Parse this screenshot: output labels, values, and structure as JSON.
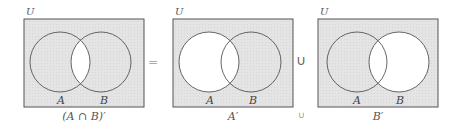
{
  "colors": {
    "shade": "#e2e2e2",
    "outline": "#555555",
    "blank": "#ffffff"
  },
  "diagrams": [
    {
      "universe_label": "U",
      "set_a_label": "A",
      "set_b_label": "B",
      "caption": "(A ∩ B)′",
      "shaded_region": "complement of A∩B"
    },
    {
      "universe_label": "U",
      "set_a_label": "A",
      "set_b_label": "B",
      "caption": "A′",
      "shaded_region": "complement of A"
    },
    {
      "universe_label": "U",
      "set_a_label": "A",
      "set_b_label": "B",
      "caption": "B′",
      "shaded_region": "complement of B"
    }
  ],
  "operators": {
    "equals": "=",
    "union": "∪",
    "union_small": "∪"
  }
}
